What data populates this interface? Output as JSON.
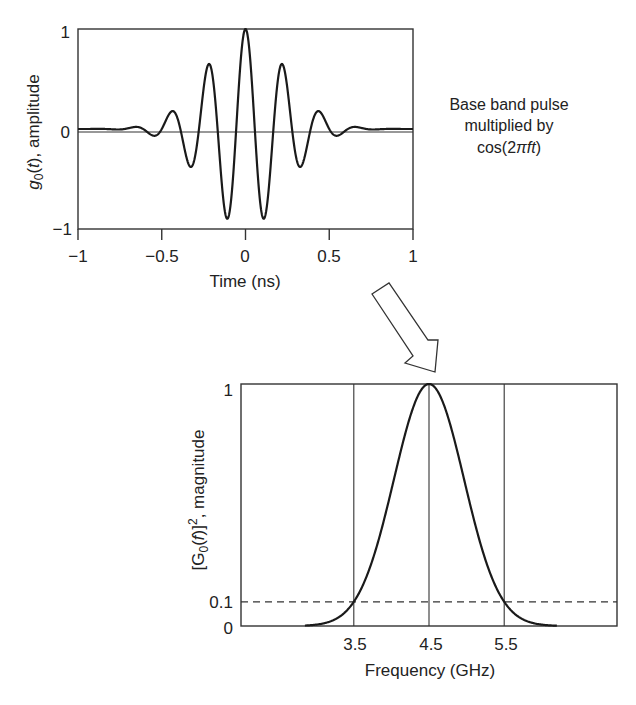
{
  "chart_data": [
    {
      "type": "line",
      "title": "",
      "xlabel": "Time (ns)",
      "ylabel_parts": {
        "g": "g",
        "sub": "0",
        "t": "t",
        "rest": ", amplitude"
      },
      "ylabel": "g0(t), amplitude",
      "xlim": [
        -1,
        1
      ],
      "ylim": [
        -1,
        1
      ],
      "xticks": [
        -1,
        -0.5,
        0,
        0.5,
        1
      ],
      "xtick_labels": [
        "−1",
        "−0.5",
        "0",
        "0.5",
        "1"
      ],
      "yticks": [
        -1,
        0,
        1
      ],
      "ytick_labels": [
        "−1",
        "0",
        "1"
      ],
      "grid": false,
      "zero_line": true,
      "series": [
        {
          "name": "g0(t)",
          "model": "gaussian-modulated cosine",
          "carrier_freq_ghz": 4.5,
          "sigma_ns": 0.237,
          "key_points": [
            {
              "t": -0.72,
              "y": 0.02
            },
            {
              "t": -0.6,
              "y": -0.03
            },
            {
              "t": -0.48,
              "y": 0.13
            },
            {
              "t": -0.36,
              "y": -0.32
            },
            {
              "t": -0.24,
              "y": 0.6
            },
            {
              "t": -0.12,
              "y": -0.87
            },
            {
              "t": 0,
              "y": 1.0
            },
            {
              "t": 0.12,
              "y": -0.87
            },
            {
              "t": 0.24,
              "y": 0.6
            },
            {
              "t": 0.36,
              "y": -0.32
            },
            {
              "t": 0.48,
              "y": 0.13
            },
            {
              "t": 0.6,
              "y": -0.03
            },
            {
              "t": 0.72,
              "y": 0.02
            }
          ]
        }
      ]
    },
    {
      "type": "line",
      "title": "",
      "xlabel": "Frequency (GHz)",
      "ylabel": "[G0(f)]^2, magnitude",
      "ylabel_parts": {
        "pre": "[G",
        "sub": "0",
        "mid": "(",
        "f": "f",
        "post": ")]",
        "sup": "2",
        "rest": ", magnitude"
      },
      "xlim": [
        2.0,
        7.0
      ],
      "ylim": [
        0,
        1
      ],
      "xticks": [
        3.5,
        4.5,
        5.5
      ],
      "xtick_labels": [
        "3.5",
        "4.5",
        "5.5"
      ],
      "yticks": [
        0,
        0.1,
        1
      ],
      "ytick_labels": [
        "0",
        "0.1",
        "1"
      ],
      "grid": false,
      "reference_lines": {
        "vertical": [
          3.5,
          4.5,
          5.5
        ],
        "horizontal_dashed": 0.1
      },
      "series": [
        {
          "name": "[G0(f)]^2",
          "model": "gaussian",
          "center_ghz": 4.5,
          "sigma_ghz": 0.466,
          "visible_range_ghz": [
            2.85,
            6.2
          ],
          "key_points": [
            {
              "f": 3.0,
              "y": 0.006
            },
            {
              "f": 3.5,
              "y": 0.1
            },
            {
              "f": 4.0,
              "y": 0.56
            },
            {
              "f": 4.5,
              "y": 1.0
            },
            {
              "f": 5.0,
              "y": 0.56
            },
            {
              "f": 5.5,
              "y": 0.1
            },
            {
              "f": 6.0,
              "y": 0.006
            }
          ]
        }
      ]
    }
  ],
  "annotation": {
    "lines": [
      "Base band pulse",
      "multiplied by"
    ],
    "formula_prefix": "cos(2",
    "formula_pi": "π",
    "formula_ft": "ft",
    "formula_suffix": ")"
  },
  "arrow": {
    "icon": "hollow-arrow-down-right",
    "meaning": "time-to-frequency transform"
  }
}
